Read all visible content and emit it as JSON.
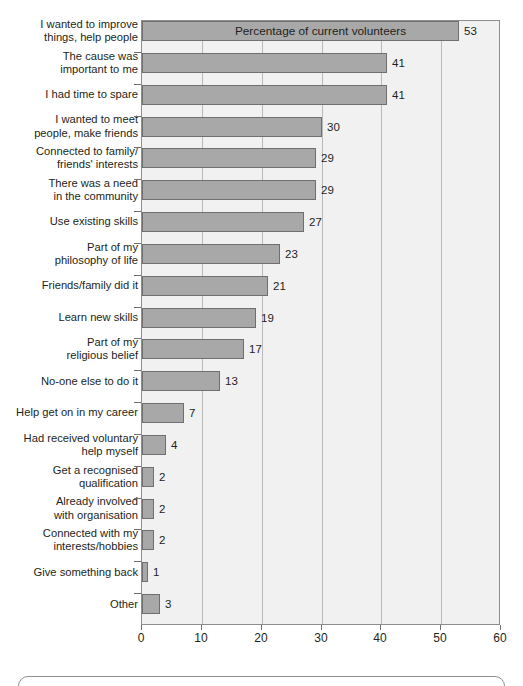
{
  "chart_data": {
    "type": "bar",
    "orientation": "horizontal",
    "title": "",
    "xlabel": "Percentage of current volunteers",
    "ylabel": "",
    "xlim": [
      0,
      60
    ],
    "xticks": [
      0,
      10,
      20,
      30,
      40,
      50,
      60
    ],
    "grid": true,
    "legend": false,
    "bar_color": "#a8a8a8",
    "bar_border_color": "#6f6f6f",
    "plot_background": "#f1f1f1",
    "categories": [
      "I wanted to improve\nthings, help people",
      "The cause was\nimportant to me",
      "I had time to spare",
      "I wanted to meet\npeople, make friends",
      "Connected to family/\nfriends' interests",
      "There was a need\nin the community",
      "Use existing skills",
      "Part of my\nphilosophy of life",
      "Friends/family did it",
      "Learn new skills",
      "Part of my\nreligious belief",
      "No-one else to do it",
      "Help get on in my career",
      "Had received voluntary\nhelp myself",
      "Get a recognised\nqualification",
      "Already involved\nwith organisation",
      "Connected with my\ninterests/hobbies",
      "Give something back",
      "Other"
    ],
    "values": [
      53,
      41,
      41,
      30,
      29,
      29,
      27,
      23,
      21,
      19,
      17,
      13,
      7,
      4,
      2,
      2,
      2,
      1,
      3
    ],
    "value_labels": [
      "53",
      "41",
      "41",
      "30",
      "29",
      "29",
      "27",
      "23",
      "21",
      "19",
      "17",
      "13",
      "7",
      "4",
      "2",
      "2",
      "2",
      "1",
      "3"
    ],
    "xtick_labels": [
      "0",
      "10",
      "20",
      "30",
      "40",
      "50",
      "60"
    ]
  }
}
